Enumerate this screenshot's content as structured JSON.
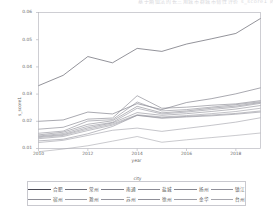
{
  "header": {
    "text": "基于熵值法的长三角城市群城市韧性评价  s_score1 时序变化"
  },
  "chart_data": {
    "type": "line",
    "title": "",
    "xlabel": "year",
    "ylabel": "s_score1",
    "xlim": [
      2010,
      2019
    ],
    "ylim": [
      0.01,
      0.06
    ],
    "grid": false,
    "legend_position": "bottom",
    "legend_title": "city",
    "xticks": [
      2010,
      2012,
      2014,
      2016,
      2018
    ],
    "yticks": [
      0.01,
      0.02,
      0.03,
      0.04,
      0.05,
      0.06
    ],
    "x": [
      2010,
      2011,
      2012,
      2013,
      2014,
      2015,
      2016,
      2017,
      2018,
      2019
    ],
    "series": [
      {
        "name": "合肥",
        "values": [
          0.0331,
          0.0369,
          0.0438,
          0.0415,
          0.0468,
          0.0457,
          0.0484,
          0.0503,
          0.0523,
          0.0578
        ]
      },
      {
        "name": "常州",
        "values": [
          0.02,
          0.0205,
          0.0234,
          0.0227,
          0.0265,
          0.0243,
          0.0269,
          0.0283,
          0.0301,
          0.0323
        ]
      },
      {
        "name": "南通",
        "values": [
          0.0171,
          0.0178,
          0.0208,
          0.0212,
          0.0294,
          0.0248,
          0.0252,
          0.0259,
          0.0264,
          0.0276
        ]
      },
      {
        "name": "盐城",
        "values": [
          0.0156,
          0.0164,
          0.0201,
          0.0206,
          0.0271,
          0.0238,
          0.0243,
          0.0252,
          0.0261,
          0.0272
        ]
      },
      {
        "name": "扬州",
        "values": [
          0.015,
          0.016,
          0.0189,
          0.0202,
          0.0255,
          0.0231,
          0.0238,
          0.0248,
          0.0256,
          0.0269
        ]
      },
      {
        "name": "镇江",
        "values": [
          0.0146,
          0.0155,
          0.0182,
          0.0196,
          0.0248,
          0.0227,
          0.0234,
          0.0243,
          0.0252,
          0.0266
        ]
      },
      {
        "name": "宿州",
        "values": [
          0.0143,
          0.0151,
          0.0176,
          0.0194,
          0.0232,
          0.0222,
          0.0228,
          0.0236,
          0.0245,
          0.0258
        ]
      },
      {
        "name": "滁州",
        "values": [
          0.014,
          0.0148,
          0.0171,
          0.019,
          0.0224,
          0.0216,
          0.0221,
          0.0228,
          0.0236,
          0.0248
        ]
      },
      {
        "name": "苏州",
        "values": [
          0.0136,
          0.0144,
          0.0166,
          0.0186,
          0.0222,
          0.0213,
          0.0218,
          0.0223,
          0.0229,
          0.0238
        ]
      },
      {
        "name": "徐州",
        "values": [
          0.0128,
          0.0134,
          0.0154,
          0.0181,
          0.0222,
          0.0211,
          0.0216,
          0.022,
          0.0226,
          0.0234
        ]
      },
      {
        "name": "金华",
        "values": [
          0.0122,
          0.013,
          0.0148,
          0.0167,
          0.0175,
          0.0163,
          0.0174,
          0.0185,
          0.0197,
          0.0213
        ]
      },
      {
        "name": "台州",
        "values": [
          0.0088,
          0.0098,
          0.011,
          0.0127,
          0.0144,
          0.0123,
          0.0132,
          0.014,
          0.0148,
          0.0157
        ]
      }
    ]
  }
}
